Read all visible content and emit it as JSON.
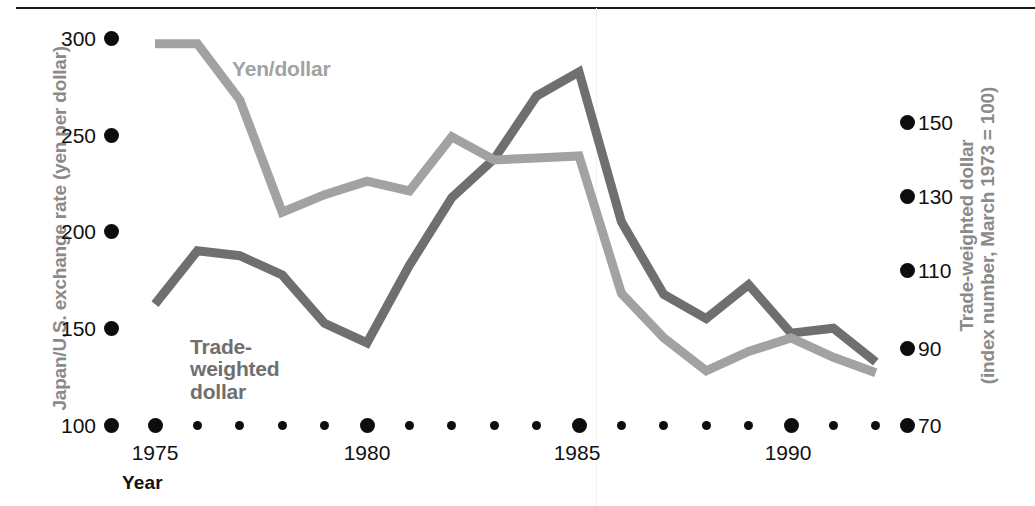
{
  "chart_data": {
    "type": "line",
    "title": "",
    "xlabel": "Year",
    "grid": false,
    "legend_position": "inline-labels",
    "x": [
      1975,
      1976,
      1977,
      1978,
      1979,
      1980,
      1981,
      1982,
      1983,
      1984,
      1985,
      1986,
      1987,
      1988,
      1989,
      1990,
      1991,
      1992
    ],
    "axes": {
      "left": {
        "label": "Japan/U.S. exchange rate (yen per dollar)",
        "ticks": [
          100,
          150,
          200,
          250,
          300
        ],
        "ylim": [
          100,
          300
        ]
      },
      "right": {
        "label_line1": "Trade-weighted dollar",
        "label_line2": "(index number, March 1973 = 100)",
        "ticks": [
          70,
          90,
          110,
          130,
          150
        ],
        "ylim": [
          70,
          150
        ]
      },
      "x": {
        "major_ticks": [
          1975,
          1980,
          1985,
          1990
        ],
        "minor_ticks": [
          1976,
          1977,
          1978,
          1979,
          1981,
          1982,
          1983,
          1984,
          1986,
          1987,
          1988,
          1989,
          1991,
          1992
        ],
        "xlim": [
          1975,
          1992
        ]
      }
    },
    "series": [
      {
        "name": "Yen/dollar",
        "axis": "left",
        "color": "#a2a2a2",
        "label_text": "Yen/dollar",
        "values": [
          297,
          297,
          268,
          210,
          219,
          226,
          221,
          249,
          237,
          238,
          239,
          168,
          145,
          128,
          138,
          145,
          135,
          127
        ]
      },
      {
        "name": "Trade-weighted dollar",
        "axis": "right",
        "color": "#6f6f6f",
        "label_text": "Trade-\nweighted\ndollar",
        "values": [
          95,
          106,
          105,
          101,
          91,
          87,
          103,
          117,
          125,
          138,
          143,
          112,
          97,
          92,
          99,
          89,
          90,
          83
        ]
      }
    ]
  },
  "geometry": {
    "note": "pixel mapping used by the renderer",
    "x0_px": 155,
    "x_step_px": 42.4,
    "left_y100_px": 425,
    "left_per_unit_px": 1.935,
    "right_y70_px": 425,
    "right_per_unit_px": 4.8375
  }
}
